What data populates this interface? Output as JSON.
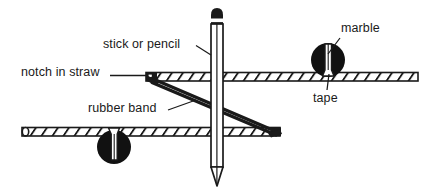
{
  "diagram": {
    "background_color": "#ffffff",
    "ink_color": "#1a1a1a",
    "labels": {
      "notch_in_straw": "notch in straw",
      "stick_or_pencil": "stick or pencil",
      "rubber_band": "rubber band",
      "marble": "marble",
      "tape": "tape"
    },
    "parts": [
      {
        "name": "upper-straw",
        "label": "straw",
        "orientation": "horizontal",
        "hatched": true
      },
      {
        "name": "lower-straw",
        "label": "straw",
        "orientation": "horizontal",
        "hatched": true
      },
      {
        "name": "pencil",
        "label": "stick or pencil",
        "orientation": "vertical"
      },
      {
        "name": "rubber-band",
        "label": "rubber band",
        "orientation": "diagonal"
      },
      {
        "name": "upper-marble",
        "label": "marble",
        "shape": "circle",
        "color": "#111111"
      },
      {
        "name": "lower-marble",
        "label": "marble",
        "shape": "circle",
        "color": "#111111"
      },
      {
        "name": "upper-tape",
        "label": "tape",
        "color": "#ffffff"
      },
      {
        "name": "lower-tape",
        "label": "tape",
        "color": "#ffffff"
      }
    ]
  }
}
